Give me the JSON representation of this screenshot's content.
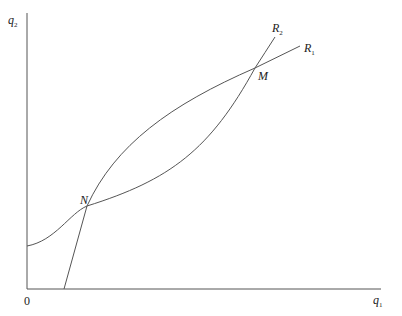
{
  "diagram": {
    "axes": {
      "y_label": "q",
      "y_label_sub": "2",
      "x_label": "q",
      "x_label_sub": "1",
      "origin_label": "0"
    },
    "curves": [
      {
        "name": "R1",
        "label": "R",
        "label_sub": "1",
        "description": "reaction curve, convex, intercept on q2 axis"
      },
      {
        "name": "R2",
        "label": "R",
        "label_sub": "2",
        "description": "reaction curve, concave, intercept on q1 axis"
      }
    ],
    "points": [
      {
        "name": "N",
        "label": "N",
        "description": "lower intersection of R1 and R2"
      },
      {
        "name": "M",
        "label": "M",
        "description": "upper intersection of R1 and R2"
      }
    ],
    "colors": {
      "line": "#555555",
      "text": "#222222",
      "background": "#ffffff"
    }
  }
}
